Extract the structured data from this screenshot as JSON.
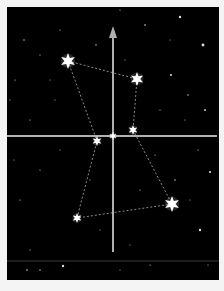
{
  "scene": {
    "background": "#000000",
    "border": "#f4f4f4",
    "frame": {
      "x": 7,
      "y": 7,
      "w": 212,
      "h": 273
    },
    "axis_color": "#b0b0b0",
    "dash_color": "#8a8a8a",
    "star_color": "#ffffff"
  },
  "axes": {
    "vertical": {
      "x": 113,
      "y1": 252,
      "y2": 30,
      "arrow": "up"
    },
    "horizontal": {
      "y": 136,
      "x1": 7,
      "x2": 217
    },
    "faint_horizontal": {
      "y": 261,
      "x1": 7,
      "x2": 219
    }
  },
  "constellation_stars": [
    {
      "name": "star-upper-left",
      "x": 68,
      "y": 61,
      "r": 8
    },
    {
      "name": "star-upper-right",
      "x": 137,
      "y": 79,
      "r": 7
    },
    {
      "name": "star-mid-right",
      "x": 133,
      "y": 130,
      "r": 5
    },
    {
      "name": "star-center",
      "x": 113,
      "y": 136,
      "r": 4
    },
    {
      "name": "star-mid-left",
      "x": 97,
      "y": 141,
      "r": 5
    },
    {
      "name": "star-lower-right",
      "x": 172,
      "y": 204,
      "r": 8
    },
    {
      "name": "star-lower-left",
      "x": 77,
      "y": 218,
      "r": 5
    }
  ],
  "dashed_links": [
    [
      68,
      61,
      137,
      79
    ],
    [
      68,
      61,
      97,
      141
    ],
    [
      137,
      79,
      133,
      130
    ],
    [
      133,
      130,
      172,
      204
    ],
    [
      172,
      204,
      77,
      218
    ],
    [
      77,
      218,
      97,
      141
    ]
  ],
  "background_stars": [
    [
      180,
      17,
      1.2
    ],
    [
      203,
      45,
      1.4
    ],
    [
      145,
      25,
      0.8
    ],
    [
      24,
      40,
      0.7
    ],
    [
      40,
      55,
      0.6
    ],
    [
      60,
      30,
      0.6
    ],
    [
      96,
      45,
      0.7
    ],
    [
      171,
      75,
      1
    ],
    [
      120,
      10,
      0.6
    ],
    [
      205,
      110,
      0.9
    ],
    [
      188,
      95,
      0.7
    ],
    [
      30,
      120,
      0.6
    ],
    [
      15,
      80,
      0.6
    ],
    [
      55,
      100,
      0.5
    ],
    [
      160,
      110,
      0.6
    ],
    [
      198,
      150,
      0.6
    ],
    [
      40,
      170,
      0.6
    ],
    [
      210,
      172,
      1.1
    ],
    [
      200,
      230,
      1.2
    ],
    [
      175,
      180,
      0.7
    ],
    [
      20,
      200,
      0.6
    ],
    [
      140,
      190,
      0.6
    ],
    [
      30,
      250,
      0.6
    ],
    [
      63,
      266,
      1.2
    ],
    [
      27,
      270,
      0.8
    ],
    [
      40,
      270,
      0.7
    ],
    [
      150,
      265,
      0.6
    ],
    [
      120,
      270,
      0.5
    ],
    [
      185,
      120,
      0.5
    ],
    [
      90,
      180,
      0.5
    ],
    [
      60,
      150,
      0.5
    ],
    [
      155,
      155,
      0.6
    ],
    [
      170,
      40,
      0.5
    ],
    [
      10,
      100,
      0.5
    ],
    [
      50,
      80,
      0.5
    ],
    [
      125,
      60,
      0.5
    ],
    [
      190,
      200,
      0.5
    ],
    [
      100,
      230,
      0.5
    ],
    [
      130,
      245,
      0.5
    ],
    [
      208,
      265,
      0.6
    ],
    [
      14,
      160,
      0.5
    ]
  ]
}
